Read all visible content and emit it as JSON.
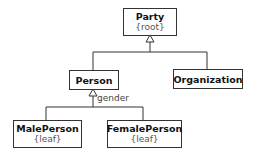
{
  "diagram": {
    "type": "UML class hierarchy",
    "classes": [
      {
        "id": "party",
        "name": "Party",
        "constraint": "{root}"
      },
      {
        "id": "person",
        "name": "Person"
      },
      {
        "id": "organization",
        "name": "Organization"
      },
      {
        "id": "maleperson",
        "name": "MalePerson",
        "constraint": "{leaf}"
      },
      {
        "id": "femaleperson",
        "name": "FemalePerson",
        "constraint": "{leaf}"
      }
    ],
    "generalizations": [
      {
        "from": "person",
        "to": "party"
      },
      {
        "from": "organization",
        "to": "party"
      },
      {
        "from": "maleperson",
        "to": "person",
        "discriminator": "gender"
      },
      {
        "from": "femaleperson",
        "to": "person",
        "discriminator": "gender"
      }
    ],
    "discriminator_label": "gender"
  },
  "colors": {
    "line": "#333333",
    "background": "#ffffff"
  }
}
